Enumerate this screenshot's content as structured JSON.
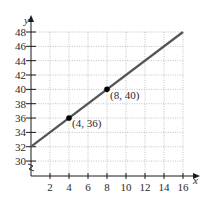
{
  "chart_data": {
    "type": "line",
    "title": "",
    "xlabel": "x",
    "ylabel": "y",
    "xlim": [
      0,
      16
    ],
    "ylim": [
      28,
      48
    ],
    "y_axis_break": true,
    "grid": true,
    "x_ticks": [
      2,
      4,
      6,
      8,
      10,
      12,
      14,
      16
    ],
    "y_ticks": [
      30,
      32,
      34,
      36,
      38,
      40,
      42,
      44,
      46,
      48
    ],
    "series": [
      {
        "name": "line",
        "x": [
          0,
          16
        ],
        "y": [
          32,
          48
        ],
        "color": "#555555"
      }
    ],
    "points": [
      {
        "x": 4,
        "y": 36,
        "label": "(4, 36)"
      },
      {
        "x": 8,
        "y": 40,
        "label": "(8, 40)"
      }
    ],
    "annotations": [
      "(4, 36)",
      "(8, 40)"
    ]
  },
  "labels": {
    "x_axis": "x",
    "y_axis": "y",
    "point_a": "(4, 36)",
    "point_b": "(8, 40)",
    "x_ticks": [
      "2",
      "4",
      "6",
      "8",
      "10",
      "12",
      "14",
      "16"
    ],
    "y_ticks": [
      "30",
      "32",
      "34",
      "36",
      "38",
      "40",
      "42",
      "44",
      "46",
      "48"
    ]
  }
}
